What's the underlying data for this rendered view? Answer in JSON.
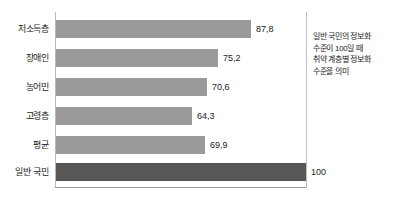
{
  "chart_data": {
    "type": "bar",
    "orientation": "horizontal",
    "title": "",
    "xlabel": "",
    "ylabel": "",
    "categories": [
      "저소득층",
      "장애인",
      "농어민",
      "고령층",
      "평균",
      "일반 국민"
    ],
    "values": [
      87.8,
      75.2,
      70.6,
      64.3,
      69.9,
      100
    ],
    "value_labels": [
      "87,8",
      "75,2",
      "70,6",
      "64,3",
      "69,9",
      "100"
    ],
    "xlim": [
      0,
      100
    ],
    "grid": false,
    "legend": "none",
    "series": [
      {
        "name": "정보화 수준",
        "values": [
          87.8,
          75.2,
          70.6,
          64.3,
          69.9,
          100
        ]
      }
    ],
    "annotations": [
      "일반 국민의 정보화",
      "수준이 100일 때",
      "취약 계층별 정보화",
      "수준을 의미"
    ]
  },
  "bars": [
    {
      "label": "저소득층",
      "value_label": "87,8",
      "width_px": 195,
      "top_px": 20,
      "style": "light"
    },
    {
      "label": "장애인",
      "value_label": "75,2",
      "width_px": 162,
      "top_px": 49,
      "style": "light"
    },
    {
      "label": "농어민",
      "value_label": "70,6",
      "width_px": 151,
      "top_px": 78,
      "style": "light"
    },
    {
      "label": "고령층",
      "value_label": "64,3",
      "width_px": 136,
      "top_px": 107,
      "style": "light"
    },
    {
      "label": "평균",
      "value_label": "69,9",
      "width_px": 149,
      "top_px": 136,
      "style": "light"
    },
    {
      "label": "일반 국민",
      "value_label": "100",
      "width_px": 250,
      "top_px": 163,
      "style": "dark"
    }
  ],
  "colors": {
    "bar_light": "#9a9a9a",
    "bar_dark": "#585858",
    "axis": "#b9b9b9",
    "text": "#1c1c1c",
    "background": "#ffffff"
  },
  "annotation": {
    "line1": "일반 국민의 정보화",
    "line2": "수준이 100일 때",
    "line3": "취약 계층별 정보화",
    "line4": "수준을 의미"
  }
}
